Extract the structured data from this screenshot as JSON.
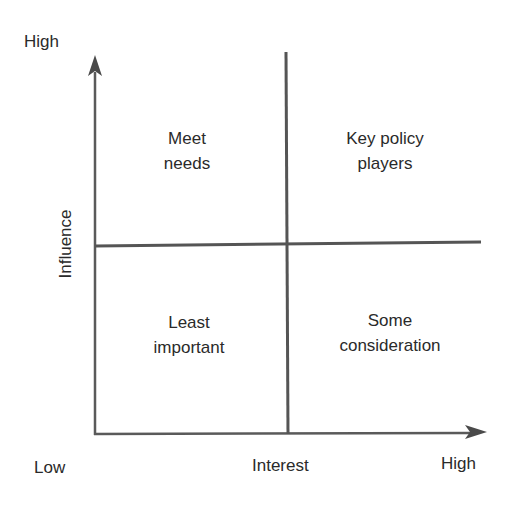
{
  "diagram": {
    "type": "2x2 matrix",
    "y_axis": {
      "label": "Influence",
      "high": "High",
      "low": "Low"
    },
    "x_axis": {
      "label": "Interest",
      "high": "High",
      "low": "Low"
    },
    "quadrants": {
      "top_left": {
        "line1": "Meet",
        "line2": "needs"
      },
      "top_right": {
        "line1": "Key policy",
        "line2": "players"
      },
      "bottom_left": {
        "line1": "Least",
        "line2": "important"
      },
      "bottom_right": {
        "line1": "Some",
        "line2": "consideration"
      }
    },
    "colors": {
      "line": "#555555",
      "text": "#2a2a2a"
    }
  }
}
